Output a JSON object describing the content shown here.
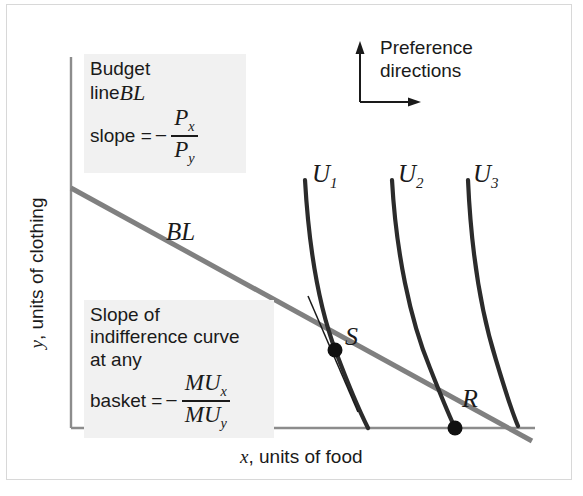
{
  "figure": {
    "type": "indifference-curve-budget-line-diagram",
    "background": "#ffffff",
    "border_color": "#d8d8d8"
  },
  "axes": {
    "color": "#8c8c8c",
    "origin": [
      71,
      428
    ],
    "x_axis_label_var": "x",
    "x_axis_label_text": ", units of food",
    "y_axis_label_var": "y",
    "y_axis_label_text": ", units of clothing"
  },
  "budget_line": {
    "label": "BL",
    "color": "#808080",
    "width": 5,
    "start": [
      71,
      188
    ],
    "end": [
      532,
      441
    ]
  },
  "indifference_curves": [
    {
      "id": "U1",
      "base": "U",
      "sub": "1",
      "color": "#2b2b2b",
      "label_x": 312,
      "label_y": 168
    },
    {
      "id": "U2",
      "base": "U",
      "sub": "2",
      "color": "#2b2b2b",
      "label_x": 398,
      "label_y": 168
    },
    {
      "id": "U3",
      "base": "U",
      "sub": "3",
      "color": "#2b2b2b",
      "label_x": 473,
      "label_y": 168
    }
  ],
  "points": [
    {
      "id": "S",
      "label": "S",
      "x": 335,
      "y": 350,
      "label_x": 345,
      "label_y": 324
    },
    {
      "id": "R",
      "label": "R",
      "x": 455,
      "y": 428,
      "label_x": 462,
      "label_y": 388
    }
  ],
  "tangent_line": {
    "color": "#1a1a1a",
    "width": 1.4,
    "start": [
      308,
      296
    ],
    "end": [
      358,
      412
    ]
  },
  "preference_arrows": {
    "text_line1": "Preference",
    "text_line2": "directions",
    "color": "#1a1a1a",
    "corner": [
      360,
      102
    ],
    "up_tip": [
      360,
      44
    ],
    "right_tip": [
      420,
      102
    ]
  },
  "budget_box": {
    "background": "#f1f1f1",
    "line1": "Budget",
    "line2_prefix": "line ",
    "line2_math": "BL",
    "line3_prefix": "slope = ",
    "minus": "−",
    "numerator_base": "P",
    "numerator_sub": "x",
    "denominator_base": "P",
    "denominator_sub": "y"
  },
  "mrs_box": {
    "background": "#f1f1f1",
    "line1": "Slope of",
    "line2": "indifference curve",
    "line3": "at any",
    "line4_prefix": "basket = ",
    "minus": "−",
    "numerator_base": "MU",
    "numerator_sub": "x",
    "denominator_base": "MU",
    "denominator_sub": "y"
  }
}
